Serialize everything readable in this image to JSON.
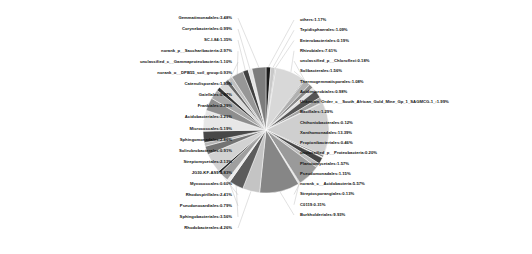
{
  "chart_data": {
    "type": "pie",
    "title": "",
    "subtitle": "",
    "xlabel": "",
    "ylabel": "",
    "legend_position": "none",
    "grid": false,
    "units": "percent",
    "total_percent": 100.0,
    "label_format": "name:value%",
    "categories": [
      "others",
      "Tepidisphaerales",
      "Enterobacteriales",
      "Rhizobiales",
      "unclassified_p__Chloroflexi",
      "Solibacterales",
      "Thermogemmatisporales",
      "Acidimicrobiales",
      "Unknown_Order_c__South_African_Gold_Mine_Gp_1_SAGMCG-1_",
      "Bacillales",
      "Chthoniobacterales",
      "Xanthomonadales",
      "Propionibacteriales",
      "unclassified_p__Proteobacteria",
      "Planctomycetales",
      "Pseudomonadales",
      "norank_c__Acidobacteria",
      "Streptosporangiales",
      "C0119",
      "Burkholderiales",
      "Rhodobacterales",
      "Sphingobacteriales",
      "Pseudonocardiales",
      "Rhodospirillales",
      "Myxococcales",
      "JG30-KF-AS9",
      "Streptomycetales",
      "Solirubrobacterales",
      "Sphingomonadales",
      "Micrococcales",
      "Acidobacteriales",
      "Frankiales",
      "Gaiellales",
      "Catenulisporales",
      "norank_o__DPB55_soil_group",
      "unclassified_c__Gammaproteobacteria",
      "norank_p__Saccharibacteria",
      "SC-I-84",
      "Corynebacteriales",
      "Gemmatimonadales"
    ],
    "values": [
      1.17,
      1.09,
      0.19,
      7.61,
      0.18,
      1.56,
      1.08,
      0.98,
      1.99,
      1.29,
      0.12,
      13.39,
      0.46,
      0.2,
      1.57,
      1.15,
      5.57,
      0.13,
      0.31,
      9.93,
      4.26,
      3.56,
      0.79,
      2.41,
      0.6,
      4.83,
      2.13,
      0.91,
      2.86,
      5.19,
      3.21,
      2.39,
      0.97,
      1.9,
      0.93,
      1.1,
      2.97,
      1.35,
      0.99,
      3.48
    ],
    "colors": [
      "#1a1a1a",
      "#c9c9c9",
      "#6e6e6e",
      "#d8d8d8",
      "#3a3a3a",
      "#b0b0b0",
      "#8a8a8a",
      "#e2e2e2",
      "#555555",
      "#a3a3a3",
      "#2b2b2b",
      "#cfcfcf",
      "#777777",
      "#efefef",
      "#454545",
      "#bbbbbb",
      "#9a9a9a",
      "#303030",
      "#dedede",
      "#868686",
      "#c4c4c4",
      "#5c5c5c",
      "#ececec",
      "#9f9f9f",
      "#252525",
      "#d2d2d2",
      "#737373",
      "#b6b6b6",
      "#484848",
      "#e7e7e7",
      "#8e8e8e",
      "#a8a8a8",
      "#343434",
      "#dadada",
      "#666666",
      "#c0c0c0",
      "#979797",
      "#404040",
      "#e4e4e4",
      "#7c7c7c"
    ]
  },
  "labels": {
    "left": [
      {
        "name": "Gemmatimonadales",
        "value": "3.48%",
        "text": "Gemmatimonadales:3.48%"
      },
      {
        "name": "Corynebacteriales",
        "value": "0.99%",
        "text": "Corynebacteriales:0.99%"
      },
      {
        "name": "SC-I-84",
        "value": "1.35%",
        "text": "SC-I-84:1.35%"
      },
      {
        "name": "norank_p__Saccharibacteria",
        "value": "2.97%",
        "text": "norank_p__Saccharibacteria:2.97%"
      },
      {
        "name": "unclassified_c__Gammaproteobacteria",
        "value": "1.10%",
        "text": "unclassified_c__Gammaproteobacteria:1.10%"
      },
      {
        "name": "norank_o__DPB55_soil_group",
        "value": "0.93%",
        "text": "norank_o__DPB55_soil_group:0.93%"
      },
      {
        "name": "Catenulisporales",
        "value": "1.90%",
        "text": "Catenulisporales:1.90%"
      },
      {
        "name": "Gaiellales",
        "value": "0.97%",
        "text": "Gaiellales:0.97%"
      },
      {
        "name": "Frankiales",
        "value": "2.39%",
        "text": "Frankiales:2.39%"
      },
      {
        "name": "Acidobacteriales",
        "value": "3.21%",
        "text": "Acidobacteriales:3.21%"
      },
      {
        "name": "Micrococcales",
        "value": "5.19%",
        "text": "Micrococcales:5.19%"
      },
      {
        "name": "Sphingomonadales",
        "value": "2.86%",
        "text": "Sphingomonadales:2.86%"
      },
      {
        "name": "Solirubrobacterales",
        "value": "0.91%",
        "text": "Solirubrobacterales:0.91%"
      },
      {
        "name": "Streptomycetales",
        "value": "2.13%",
        "text": "Streptomycetales:2.13%"
      },
      {
        "name": "JG30-KF-AS9",
        "value": "4.83%",
        "text": "JG30-KF-AS9:4.83%"
      },
      {
        "name": "Myxococcales",
        "value": "0.60%",
        "text": "Myxococcales:0.60%"
      },
      {
        "name": "Rhodospirillales",
        "value": "2.41%",
        "text": "Rhodospirillales:2.41%"
      },
      {
        "name": "Pseudonocardiales",
        "value": "0.79%",
        "text": "Pseudonocardiales:0.79%"
      },
      {
        "name": "Sphingobacteriales",
        "value": "3.56%",
        "text": "Sphingobacteriales:3.56%"
      },
      {
        "name": "Rhodobacterales",
        "value": "4.26%",
        "text": "Rhodobacterales:4.26%"
      }
    ],
    "right": [
      {
        "name": "others",
        "value": "1.17%",
        "text": "others:1.17%"
      },
      {
        "name": "Tepidisphaerales",
        "value": "1.09%",
        "text": "Tepidisphaerales:1.09%"
      },
      {
        "name": "Enterobacteriales",
        "value": "0.19%",
        "text": "Enterobacteriales:0.19%"
      },
      {
        "name": "Rhizobiales",
        "value": "7.61%",
        "text": "Rhizobiales:7.61%"
      },
      {
        "name": "unclassified_p__Chloroflexi",
        "value": "0.18%",
        "text": "unclassified_p__Chloroflexi:0.18%"
      },
      {
        "name": "Solibacterales",
        "value": "1.56%",
        "text": "Solibacterales:1.56%"
      },
      {
        "name": "Thermogemmatisporales",
        "value": "1.08%",
        "text": "Thermogemmatisporales:1.08%"
      },
      {
        "name": "Acidimicrobiales",
        "value": "0.98%",
        "text": "Acidimicrobiales:0.98%"
      },
      {
        "name": "Unknown_Order_c__South_African_Gold_Mine_Gp_1_SAGMCG-1_",
        "value": "1.99%",
        "text": "Unknown_Order_c__South_African_Gold_Mine_Gp_1_SAGMCG-1_:1.99%"
      },
      {
        "name": "Bacillales",
        "value": "1.29%",
        "text": "Bacillales:1.29%"
      },
      {
        "name": "Chthoniobacterales",
        "value": "0.12%",
        "text": "Chthoniobacterales:0.12%"
      },
      {
        "name": "Xanthomonadales",
        "value": "13.39%",
        "text": "Xanthomonadales:13.39%"
      },
      {
        "name": "Propionibacteriales",
        "value": "0.46%",
        "text": "Propionibacteriales:0.46%"
      },
      {
        "name": "unclassified_p__Proteobacteria",
        "value": "0.20%",
        "text": "unclassified_p__Proteobacteria:0.20%"
      },
      {
        "name": "Planctomycetales",
        "value": "1.57%",
        "text": "Planctomycetales:1.57%"
      },
      {
        "name": "Pseudomonadales",
        "value": "1.15%",
        "text": "Pseudomonadales:1.15%"
      },
      {
        "name": "norank_c__Acidobacteria",
        "value": "5.57%",
        "text": "norank_c__Acidobacteria:5.57%"
      },
      {
        "name": "Streptosporangiales",
        "value": "0.13%",
        "text": "Streptosporangiales:0.13%"
      },
      {
        "name": "C0119",
        "value": "0.31%",
        "text": "C0119:0.31%"
      },
      {
        "name": "Burkholderiales",
        "value": "9.93%",
        "text": "Burkholderiales:9.93%"
      }
    ]
  }
}
